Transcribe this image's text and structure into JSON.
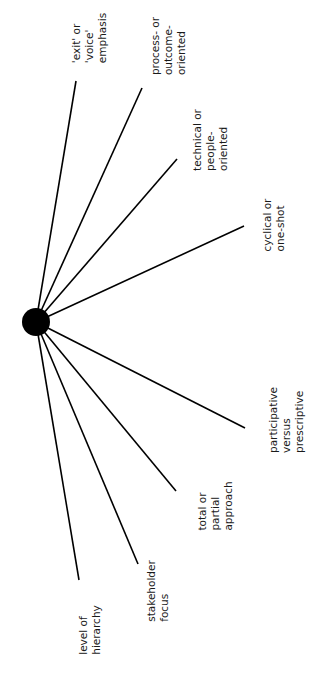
{
  "diagram": {
    "type": "radial-spoke",
    "hub": {
      "cx": 36,
      "cy": 322,
      "r": 14,
      "color": "#000000"
    },
    "line_color": "#000000",
    "text_color": "#1a1a1a",
    "spokes": [
      {
        "id": "exit-voice",
        "label": "'exit' or\n'voice'\nemphasis",
        "x2": 76,
        "y2": 81,
        "lx": 89,
        "ly": 38
      },
      {
        "id": "process-outcome",
        "label": "process- or\noutcome-\noriented",
        "x2": 142,
        "y2": 88,
        "lx": 168,
        "ly": 46
      },
      {
        "id": "technical-people",
        "label": "technical or\npeople-\noriented",
        "x2": 177,
        "y2": 159,
        "lx": 210,
        "ly": 140
      },
      {
        "id": "cyclical-oneshot",
        "label": "cyclical or\none-shot",
        "x2": 244,
        "y2": 226,
        "lx": 274,
        "ly": 225
      },
      {
        "id": "participative-prescriptive",
        "label": "participative\nversus\nprescriptive",
        "x2": 245,
        "y2": 428,
        "lx": 286,
        "ly": 420
      },
      {
        "id": "total-partial",
        "label": "total or\npartial\napproach",
        "x2": 176,
        "y2": 491,
        "lx": 215,
        "ly": 506
      },
      {
        "id": "stakeholder-focus",
        "label": "stakeholder\nfocus",
        "x2": 138,
        "y2": 564,
        "lx": 158,
        "ly": 591
      },
      {
        "id": "level-of-hierarchy",
        "label": "level of\nhierarchy",
        "x2": 79,
        "y2": 580,
        "lx": 90,
        "ly": 630
      }
    ]
  }
}
